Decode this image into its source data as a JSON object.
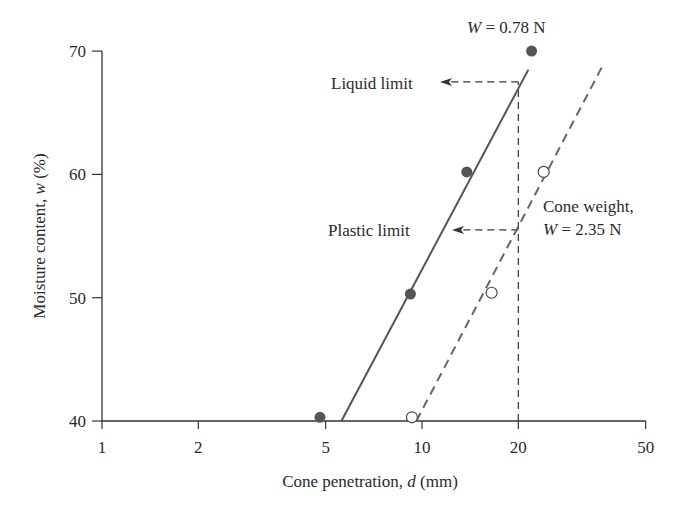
{
  "chart_data": {
    "type": "scatter",
    "title": "",
    "xlabel": "Cone penetration, d (mm)",
    "xlabel_parts": {
      "pre": "Cone penetration, ",
      "var": "d",
      "post": " (mm)"
    },
    "ylabel": "Moisture content, w (%)",
    "ylabel_parts": {
      "pre": "Moisture content, ",
      "var": "w",
      "post": " (%)"
    },
    "xscale": "log",
    "xlim": [
      1,
      50
    ],
    "ylim": [
      40,
      70
    ],
    "xticks": [
      1,
      2,
      5,
      10,
      20,
      50
    ],
    "xtick_labels": [
      "1",
      "2",
      "5",
      "10",
      "20",
      "50"
    ],
    "yticks": [
      40,
      50,
      60,
      70
    ],
    "ytick_labels": [
      "40",
      "50",
      "60",
      "70"
    ],
    "grid": false,
    "series": [
      {
        "name": "W = 0.78 N",
        "marker": "filled-circle",
        "line": "solid",
        "x": [
          4.8,
          9.2,
          13.8,
          22.0
        ],
        "y": [
          40.3,
          50.3,
          60.2,
          70.0
        ],
        "fit_line": {
          "x": [
            5.6,
            21.5
          ],
          "y": [
            40.0,
            68.5
          ]
        }
      },
      {
        "name": "Cone weight, W = 2.35 N",
        "marker": "open-circle",
        "line": "dashed",
        "x": [
          9.3,
          16.5,
          24.0
        ],
        "y": [
          40.3,
          50.4,
          60.2
        ],
        "fit_line": {
          "x": [
            9.6,
            37.0
          ],
          "y": [
            40.0,
            69.0
          ]
        }
      }
    ],
    "reference_lines": {
      "vertical_d": 20,
      "liquid_limit_w": 67.5,
      "plastic_limit_w": 55.5
    },
    "annotations": [
      {
        "id": "w-078",
        "text": "W = 0.78 N",
        "var": "W",
        "rest": " = 0.78 N"
      },
      {
        "id": "liquid-limit",
        "text": "Liquid limit"
      },
      {
        "id": "plastic-limit",
        "text": "Plastic limit"
      },
      {
        "id": "cone-weight-line1",
        "text": "Cone weight,"
      },
      {
        "id": "cone-weight-line2",
        "text": "W = 2.35 N",
        "var": "W",
        "rest": " = 2.35 N"
      }
    ],
    "colors": {
      "axis": "#333333",
      "filled_marker": "#555555",
      "solid_line": "#555555",
      "dashed_line": "#666666",
      "reference": "#333333"
    }
  }
}
